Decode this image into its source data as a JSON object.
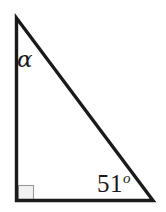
{
  "figure": {
    "name": "right-triangle-diagram",
    "background_color": "#ffffff",
    "width": 166,
    "height": 212,
    "stroke_color": "#1a1a1a",
    "stroke_width": 3.4,
    "right_angle_marker_color": "#9a9a9a",
    "right_angle_marker_fill": "#f2f2f2"
  },
  "geometry": {
    "apex": {
      "x": 16,
      "y": 18
    },
    "bottom_left": {
      "x": 16,
      "y": 201
    },
    "bottom_right": {
      "x": 153,
      "y": 201
    },
    "right_angle_marker": {
      "x": 18,
      "y": 185,
      "size": 15
    }
  },
  "labels": {
    "top_angle": {
      "text": "α",
      "name": "alpha-angle-label",
      "at_vertex": "apex"
    },
    "bottom_right_angle": {
      "value": "51",
      "degree_symbol": "o",
      "full_text": "51o",
      "name": "angle-51-degrees-label",
      "at_vertex": "bottom_right"
    },
    "right_angle": {
      "name": "right-angle-marker",
      "value": "90",
      "at_vertex": "bottom_left"
    }
  }
}
